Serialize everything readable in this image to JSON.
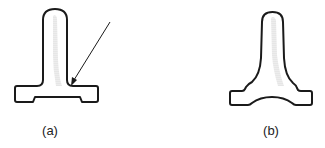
{
  "figure": {
    "panels": [
      {
        "id": "a",
        "label": "(a)",
        "description": "T-shaped part with notched flange base; arrow points to fillet at post-flange junction",
        "has_arrow": true
      },
      {
        "id": "b",
        "label": "(b)",
        "description": "T-shaped part with stepped fillet transitions and arched flange base"
      }
    ],
    "colors": {
      "outline": "#1a1a1a",
      "shading": "#b8b8b8",
      "background": "#ffffff"
    }
  }
}
